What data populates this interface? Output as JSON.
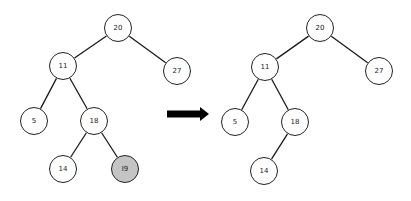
{
  "diagram": {
    "type": "binary-search-tree-deletion",
    "arrow": {
      "from": [
        167,
        114
      ],
      "to": [
        209,
        114
      ],
      "color": "#000000"
    },
    "highlight_color": "#c4c4c4",
    "before": {
      "nodes": [
        {
          "id": "b20",
          "label": "20",
          "x": 118,
          "y": 28
        },
        {
          "id": "b11",
          "label": "11",
          "x": 63,
          "y": 66
        },
        {
          "id": "b27",
          "label": "27",
          "x": 177,
          "y": 71
        },
        {
          "id": "b5",
          "label": "5",
          "x": 34,
          "y": 121
        },
        {
          "id": "b18",
          "label": "18",
          "x": 94,
          "y": 121
        },
        {
          "id": "b14",
          "label": "14",
          "x": 63,
          "y": 169
        },
        {
          "id": "b19",
          "label": "I9",
          "x": 125,
          "y": 169,
          "highlighted": true
        }
      ],
      "edges": [
        [
          "b20",
          "b11"
        ],
        [
          "b20",
          "b27"
        ],
        [
          "b11",
          "b5"
        ],
        [
          "b11",
          "b18"
        ],
        [
          "b18",
          "b14"
        ],
        [
          "b18",
          "b19"
        ]
      ]
    },
    "after": {
      "nodes": [
        {
          "id": "a20",
          "label": "20",
          "x": 320,
          "y": 28
        },
        {
          "id": "a11",
          "label": "11",
          "x": 265,
          "y": 67
        },
        {
          "id": "a27",
          "label": "27",
          "x": 379,
          "y": 71
        },
        {
          "id": "a5",
          "label": "5",
          "x": 235,
          "y": 122
        },
        {
          "id": "a18",
          "label": "18",
          "x": 295,
          "y": 122
        },
        {
          "id": "a14",
          "label": "14",
          "x": 264,
          "y": 171
        }
      ],
      "edges": [
        [
          "a20",
          "a11"
        ],
        [
          "a20",
          "a27"
        ],
        [
          "a11",
          "a5"
        ],
        [
          "a11",
          "a18"
        ],
        [
          "a18",
          "a14"
        ]
      ]
    }
  }
}
